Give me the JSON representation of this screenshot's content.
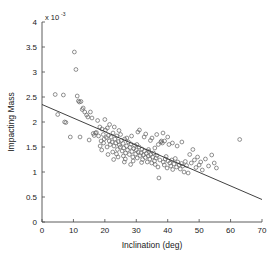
{
  "chart_data": {
    "type": "scatter",
    "title": "",
    "xlabel": "Inclination  (deg)",
    "ylabel": "Impacting Mass",
    "y_multiplier_base": "x 10",
    "y_multiplier_exponent": "-3",
    "xlim": [
      0,
      70
    ],
    "ylim": [
      0,
      4
    ],
    "xticks": [
      0,
      10,
      20,
      30,
      40,
      50,
      60,
      70
    ],
    "xtick_labels": [
      "0",
      "10",
      "20",
      "30",
      "40",
      "50",
      "60",
      "70"
    ],
    "yticks": [
      0,
      0.5,
      1,
      1.5,
      2,
      2.5,
      3,
      3.5,
      4
    ],
    "ytick_labels": [
      "0",
      "0.5",
      "1",
      "1.5",
      "2",
      "2.5",
      "3",
      "3.5",
      "4"
    ],
    "grid": false,
    "legend": null,
    "marker_style": "open-circle",
    "marker_color": "#6b6b6b",
    "line_color": "#2b2b2b",
    "background_color": "#ffffff",
    "trendline": {
      "name": "linear fit",
      "x": [
        0,
        70
      ],
      "y": [
        2.35,
        0.45
      ]
    },
    "series": [
      {
        "name": "Impacting Mass vs Inclination",
        "points": [
          [
            4.2,
            2.55
          ],
          [
            5.0,
            2.15
          ],
          [
            6.8,
            2.54
          ],
          [
            7.2,
            2.0
          ],
          [
            7.6,
            1.99
          ],
          [
            9.0,
            1.7
          ],
          [
            10.3,
            3.4
          ],
          [
            10.8,
            3.05
          ],
          [
            11.2,
            2.52
          ],
          [
            11.6,
            2.42
          ],
          [
            11.9,
            2.4
          ],
          [
            12.1,
            1.7
          ],
          [
            12.4,
            2.41
          ],
          [
            12.8,
            2.25
          ],
          [
            13.1,
            2.28
          ],
          [
            13.6,
            2.2
          ],
          [
            14.2,
            2.14
          ],
          [
            14.6,
            2.1
          ],
          [
            15.0,
            1.64
          ],
          [
            15.4,
            2.2
          ],
          [
            15.9,
            2.08
          ],
          [
            16.3,
            1.77
          ],
          [
            16.6,
            1.73
          ],
          [
            17.0,
            1.78
          ],
          [
            17.3,
            1.79
          ],
          [
            17.7,
            2.03
          ],
          [
            18.0,
            1.72
          ],
          [
            18.4,
            1.9
          ],
          [
            18.8,
            1.62
          ],
          [
            19.1,
            1.86
          ],
          [
            19.5,
            1.75
          ],
          [
            19.8,
            1.66
          ],
          [
            20.2,
            1.84
          ],
          [
            20.5,
            1.69
          ],
          [
            20.8,
            1.88
          ],
          [
            21.1,
            1.73
          ],
          [
            21.4,
            1.62
          ],
          [
            21.7,
            1.55
          ],
          [
            22.0,
            1.7
          ],
          [
            22.3,
            1.6
          ],
          [
            22.6,
            1.78
          ],
          [
            22.9,
            1.52
          ],
          [
            23.2,
            1.66
          ],
          [
            23.5,
            1.58
          ],
          [
            23.8,
            1.72
          ],
          [
            24.0,
            1.45
          ],
          [
            24.3,
            1.61
          ],
          [
            24.6,
            1.54
          ],
          [
            24.9,
            1.5
          ],
          [
            25.2,
            1.63
          ],
          [
            25.5,
            1.42
          ],
          [
            25.8,
            1.57
          ],
          [
            26.0,
            1.48
          ],
          [
            26.3,
            1.66
          ],
          [
            26.6,
            1.38
          ],
          [
            26.9,
            1.52
          ],
          [
            27.2,
            1.44
          ],
          [
            27.5,
            1.6
          ],
          [
            27.8,
            1.35
          ],
          [
            28.0,
            1.49
          ],
          [
            28.3,
            1.56
          ],
          [
            28.6,
            1.41
          ],
          [
            28.9,
            1.3
          ],
          [
            29.2,
            1.47
          ],
          [
            29.5,
            1.53
          ],
          [
            29.8,
            1.36
          ],
          [
            30.0,
            1.44
          ],
          [
            30.3,
            1.28
          ],
          [
            30.6,
            1.4
          ],
          [
            30.9,
            1.5
          ],
          [
            31.2,
            1.33
          ],
          [
            31.5,
            1.38
          ],
          [
            31.8,
            1.46
          ],
          [
            32.0,
            1.25
          ],
          [
            32.3,
            1.34
          ],
          [
            32.6,
            1.42
          ],
          [
            32.9,
            1.29
          ],
          [
            33.2,
            1.37
          ],
          [
            33.5,
            1.2
          ],
          [
            33.8,
            1.32
          ],
          [
            34.0,
            1.41
          ],
          [
            34.3,
            1.26
          ],
          [
            34.6,
            1.35
          ],
          [
            34.9,
            1.18
          ],
          [
            35.2,
            1.3
          ],
          [
            35.5,
            1.38
          ],
          [
            35.8,
            1.22
          ],
          [
            36.0,
            1.15
          ],
          [
            36.3,
            1.28
          ],
          [
            36.6,
            1.33
          ],
          [
            36.9,
            1.1
          ],
          [
            37.2,
            0.88
          ],
          [
            37.5,
            1.24
          ],
          [
            37.8,
            1.6
          ],
          [
            38.0,
            1.62
          ],
          [
            38.3,
            1.58
          ],
          [
            38.6,
            1.2
          ],
          [
            38.9,
            1.14
          ],
          [
            39.2,
            1.26
          ],
          [
            39.5,
            1.31
          ],
          [
            39.8,
            1.08
          ],
          [
            40.1,
            1.22
          ],
          [
            40.4,
            1.55
          ],
          [
            40.7,
            1.18
          ],
          [
            41.0,
            1.12
          ],
          [
            41.3,
            1.24
          ],
          [
            41.6,
            1.05
          ],
          [
            42.0,
            1.16
          ],
          [
            42.4,
            1.27
          ],
          [
            42.8,
            1.1
          ],
          [
            43.2,
            1.2
          ],
          [
            43.6,
            1.14
          ],
          [
            44.0,
            1.06
          ],
          [
            44.4,
            1.17
          ],
          [
            44.8,
            1.12
          ],
          [
            45.2,
            1.0
          ],
          [
            45.6,
            1.21
          ],
          [
            46.0,
            1.13
          ],
          [
            46.5,
            0.98
          ],
          [
            47.0,
            1.35
          ],
          [
            47.5,
            1.18
          ],
          [
            48.0,
            1.45
          ],
          [
            48.5,
            1.24
          ],
          [
            49.0,
            1.09
          ],
          [
            49.5,
            1.3
          ],
          [
            50.0,
            1.14
          ],
          [
            50.5,
            1.2
          ],
          [
            51.0,
            1.04
          ],
          [
            52.0,
            1.26
          ],
          [
            53.0,
            1.12
          ],
          [
            54.0,
            1.34
          ],
          [
            54.8,
            1.18
          ],
          [
            55.5,
            1.08
          ],
          [
            62.9,
            1.65
          ],
          [
            20.0,
            2.05
          ],
          [
            21.5,
            1.95
          ],
          [
            23.0,
            1.9
          ],
          [
            24.5,
            1.83
          ],
          [
            25.0,
            1.75
          ],
          [
            27.0,
            1.68
          ],
          [
            28.5,
            1.72
          ],
          [
            30.5,
            1.8
          ],
          [
            31.0,
            1.84
          ],
          [
            32.5,
            1.7
          ],
          [
            33.0,
            1.76
          ],
          [
            34.5,
            1.63
          ],
          [
            35.0,
            1.68
          ],
          [
            36.5,
            1.75
          ],
          [
            37.0,
            1.55
          ],
          [
            38.5,
            1.78
          ],
          [
            39.0,
            1.62
          ],
          [
            40.0,
            1.7
          ],
          [
            41.5,
            1.58
          ],
          [
            43.0,
            1.52
          ],
          [
            44.5,
            1.6
          ],
          [
            18.5,
            1.52
          ],
          [
            19.0,
            1.44
          ],
          [
            20.7,
            1.5
          ],
          [
            22.5,
            1.4
          ],
          [
            23.7,
            1.36
          ],
          [
            25.9,
            1.32
          ],
          [
            26.5,
            1.26
          ],
          [
            29.0,
            1.22
          ],
          [
            31.7,
            1.19
          ],
          [
            33.9,
            1.45
          ],
          [
            35.9,
            1.48
          ],
          [
            24.2,
            1.3
          ],
          [
            26.2,
            1.2
          ],
          [
            28.2,
            1.15
          ],
          [
            30.2,
            1.55
          ],
          [
            22.8,
            1.25
          ],
          [
            21.0,
            1.35
          ],
          [
            19.6,
            1.58
          ]
        ]
      }
    ]
  },
  "axes": {
    "x_axis_name": "inclination-axis",
    "y_axis_name": "impacting-mass-axis"
  }
}
